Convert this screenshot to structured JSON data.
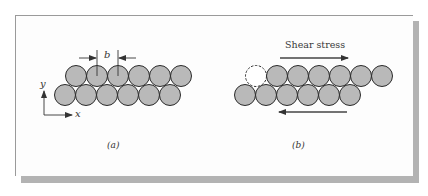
{
  "figure": {
    "panel_a": {
      "caption": "(a)",
      "spacing_label": "b",
      "axis_y_label": "y",
      "axis_x_label": "x",
      "top_row_atoms": 6,
      "bottom_row_atoms": 6
    },
    "panel_b": {
      "caption": "(b)",
      "stress_label": "Shear stress",
      "top_row_atoms": 6,
      "vacant_site": 1,
      "bottom_row_atoms": 6
    },
    "colors": {
      "atom_fill": "#b9b9b9",
      "atom_stroke": "#2a2a2a",
      "arrow": "#444444",
      "frame": "#9a9a9a",
      "shadow": "#b3b3b3"
    }
  }
}
